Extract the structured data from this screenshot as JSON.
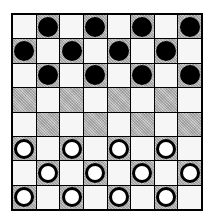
{
  "game": "checkers",
  "board": {
    "size": 8,
    "colors": {
      "light": "#f6f6f6",
      "dark": "#bdbdbd",
      "border": "#000000"
    },
    "rows": [
      [
        "",
        "b",
        "",
        "b",
        "",
        "b",
        "",
        "b"
      ],
      [
        "b",
        "",
        "b",
        "",
        "b",
        "",
        "b",
        ""
      ],
      [
        "",
        "b",
        "",
        "b",
        "",
        "b",
        "",
        "b"
      ],
      [
        "",
        "",
        "",
        "",
        "",
        "",
        "",
        ""
      ],
      [
        "",
        "",
        "",
        "",
        "",
        "",
        "",
        ""
      ],
      [
        "w",
        "",
        "w",
        "",
        "w",
        "",
        "w",
        ""
      ],
      [
        "",
        "w",
        "",
        "w",
        "",
        "w",
        "",
        "w"
      ],
      [
        "w",
        "",
        "w",
        "",
        "w",
        "",
        "w",
        ""
      ]
    ],
    "dark_parity": "odd"
  },
  "pieces": {
    "black_count": 12,
    "white_count": 12
  }
}
